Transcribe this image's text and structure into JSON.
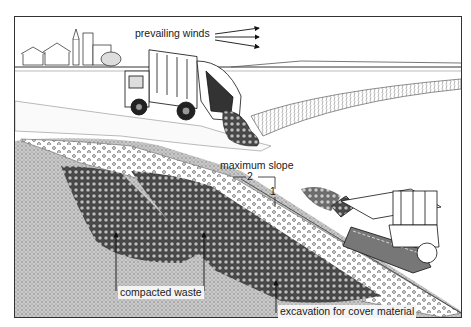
{
  "diagram": {
    "labels": {
      "prevailing_winds": "prevailing winds",
      "maximum_slope": "maximum slope",
      "slope_horizontal": "2",
      "slope_vertical": "1",
      "compacted_waste": "compacted waste",
      "excavation": "excavation for cover material"
    },
    "elements": [
      {
        "name": "village",
        "description": "distant village with church tower"
      },
      {
        "name": "refuse-truck",
        "description": "refuse collection truck tipping waste"
      },
      {
        "name": "bulldozer",
        "description": "crawler bulldozer spreading waste on slope"
      },
      {
        "name": "cover-layer",
        "description": "cover material layer (circles pattern)"
      },
      {
        "name": "waste-cells",
        "description": "compacted waste cells (dense pattern)"
      },
      {
        "name": "natural-ground",
        "description": "stippled undisturbed ground"
      }
    ],
    "colors": {
      "line": "#1a1a1a",
      "ground": "#bdbdbd",
      "waste": "#555555",
      "paper": "#ffffff"
    }
  }
}
